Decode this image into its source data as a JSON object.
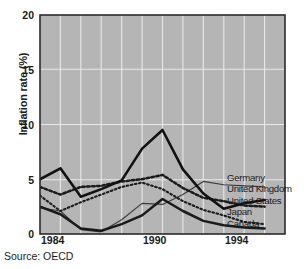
{
  "chart_data": {
    "type": "line",
    "title": "",
    "subtitle": "",
    "xlabel": "",
    "ylabel": "Inflation rate (%)",
    "xlim": [
      1984,
      1996
    ],
    "ylim": [
      0,
      20
    ],
    "yticks": [
      0,
      5,
      10,
      15,
      20
    ],
    "xticks": [
      1984,
      1990,
      1994
    ],
    "grid": true,
    "grid_color": "#e8e8e8",
    "plot_background": "#b5b5b5",
    "legend_position": "right-inside",
    "x": [
      1984,
      1985,
      1986,
      1987,
      1988,
      1989,
      1990,
      1991,
      1992,
      1993,
      1994,
      1995
    ],
    "series": [
      {
        "name": "Germany",
        "style": "thin-solid",
        "color": "#3a3a3a",
        "values": [
          2.4,
          2.1,
          0.4,
          0.2,
          1.3,
          2.8,
          2.7,
          3.6,
          4.8,
          4.5,
          4.4,
          4.3
        ]
      },
      {
        "name": "United Kingdom",
        "style": "thick-solid",
        "color": "#1a1a1a",
        "values": [
          5.0,
          6.0,
          3.4,
          4.1,
          4.9,
          7.8,
          9.5,
          5.9,
          3.7,
          2.3,
          2.8,
          3.1
        ]
      },
      {
        "name": "United States",
        "style": "dotted-bold",
        "color": "#1a1a1a",
        "values": [
          4.3,
          3.6,
          4.3,
          4.4,
          4.8,
          5.0,
          5.4,
          4.2,
          3.3,
          3.0,
          2.6,
          2.5
        ]
      },
      {
        "name": "Japan",
        "style": "dotted-fine",
        "color": "#1a1a1a",
        "values": [
          3.5,
          2.1,
          2.9,
          3.6,
          4.3,
          4.7,
          4.1,
          3.0,
          2.2,
          1.7,
          1.1,
          0.9
        ]
      },
      {
        "name": "Canada",
        "style": "thick-solid-low",
        "color": "#1a1a1a",
        "values": [
          2.5,
          1.8,
          0.5,
          0.3,
          0.9,
          1.7,
          3.2,
          2.1,
          1.2,
          0.8,
          0.6,
          0.5
        ]
      }
    ]
  },
  "axis": {
    "ylabel": "Inflation rate (%)",
    "ytick_labels": [
      "20",
      "15",
      "10",
      "5",
      "0"
    ],
    "xtick_labels": [
      "1984",
      "1990",
      "1994"
    ]
  },
  "legend": {
    "items": [
      "Germany",
      "United Kingdom",
      "United States",
      "Japan",
      "Canada"
    ]
  },
  "footer": {
    "source": "Source: OECD"
  }
}
